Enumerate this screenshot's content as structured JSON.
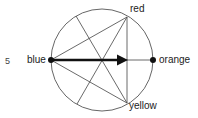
{
  "figure_number": "5",
  "labels": {
    "blue": "blue",
    "red": "red",
    "orange": "orange",
    "yellow": "yellow"
  },
  "geometry": {
    "center": [
      102,
      60
    ],
    "radius": 51,
    "points": {
      "blue": [
        51,
        60
      ],
      "orange": [
        153,
        60
      ],
      "red": [
        127,
        17
      ],
      "yellow": [
        127,
        103
      ],
      "upper_left": [
        76,
        16
      ],
      "lower_left": [
        77,
        104
      ]
    },
    "arrow": {
      "from": "blue",
      "to_x": 128
    }
  },
  "colors": {
    "stroke": "#333333",
    "text": "#222222"
  }
}
